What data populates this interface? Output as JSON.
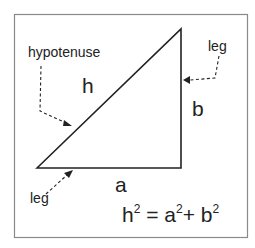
{
  "diagram": {
    "labels": {
      "hypotenuse": "hypotenuse",
      "leg_right": "leg",
      "leg_bottom": "leg",
      "h": "h",
      "a": "a",
      "b": "b"
    },
    "formula": {
      "h": "h",
      "eq": " = ",
      "a": "a",
      "plus": "+ ",
      "b": "b",
      "exp": "2"
    },
    "colors": {
      "stroke": "#222222",
      "border": "#888888",
      "background": "#ffffff"
    }
  }
}
